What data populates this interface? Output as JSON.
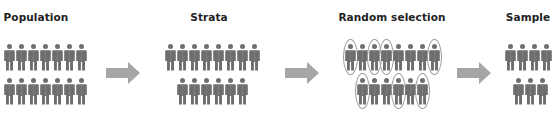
{
  "diagram": {
    "type": "process-flow",
    "colors": {
      "person": "#6e6e6e",
      "arrow": "#a6a6a6",
      "selection_ring": "#9a9a9a",
      "title_text": "#222222"
    },
    "stages": [
      {
        "label": "Population",
        "rows": [
          7,
          7
        ]
      },
      {
        "label": "Strata",
        "rows": [
          8,
          6
        ]
      },
      {
        "label": "Random selection",
        "rows": [
          8,
          6
        ],
        "selected": {
          "row_1": [
            0,
            2,
            3,
            7
          ],
          "row_2": [
            0,
            3,
            5
          ]
        }
      },
      {
        "label": "Sample",
        "rows": [
          4,
          3
        ]
      }
    ],
    "arrows": [
      "population-to-strata",
      "strata-to-random-selection",
      "random-selection-to-sample"
    ]
  }
}
